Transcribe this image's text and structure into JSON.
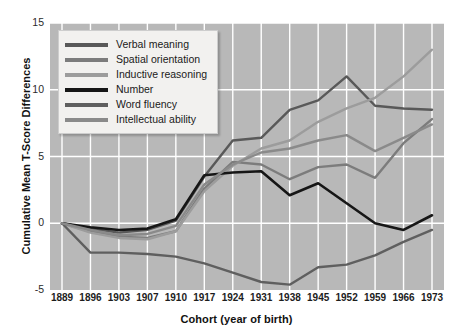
{
  "chart_data": {
    "type": "line",
    "title": "",
    "subtitle": "",
    "xlabel": "Cohort (year of birth)",
    "ylabel": "Cumulative Mean T-Score Differences",
    "categories": [
      "1889",
      "1896",
      "1903",
      "1907",
      "1910",
      "1917",
      "1924",
      "1931",
      "1938",
      "1945",
      "1952",
      "1959",
      "1966",
      "1973"
    ],
    "x": [
      1889,
      1896,
      1903,
      1907,
      1910,
      1917,
      1924,
      1931,
      1938,
      1945,
      1952,
      1959,
      1966,
      1973
    ],
    "ylim": [
      -5,
      15
    ],
    "xlim_index": [
      0,
      13
    ],
    "yticks": [
      -5,
      0,
      5,
      10,
      15
    ],
    "ytick_labels": [
      "-5",
      "0",
      "5",
      "10",
      "15"
    ],
    "grid": true,
    "grid_color": "#ffffff",
    "plot_background": "#b8b8b8",
    "legend_position": "upper-left",
    "series": [
      {
        "name": "Verbal meaning",
        "color": "#595959",
        "width": 2.4,
        "values": [
          0.0,
          -0.4,
          -0.7,
          -0.5,
          0.2,
          3.5,
          6.2,
          6.4,
          8.5,
          9.2,
          11.0,
          8.8,
          8.6,
          8.5
        ]
      },
      {
        "name": "Spatial orientation",
        "color": "#7c7c7c",
        "width": 2.4,
        "values": [
          0.0,
          -0.6,
          -1.0,
          -1.1,
          -0.6,
          2.6,
          4.6,
          4.4,
          3.3,
          4.2,
          4.4,
          3.4,
          6.0,
          7.8
        ]
      },
      {
        "name": "Inductive reasoning",
        "color": "#9c9c9c",
        "width": 2.4,
        "values": [
          0.0,
          -0.7,
          -1.1,
          -1.2,
          -0.6,
          2.4,
          4.3,
          5.6,
          6.2,
          7.6,
          8.6,
          9.4,
          11.0,
          13.0
        ]
      },
      {
        "name": "Number",
        "color": "#161616",
        "width": 2.6,
        "values": [
          0.0,
          -0.3,
          -0.5,
          -0.4,
          0.3,
          3.6,
          3.8,
          3.9,
          2.1,
          3.0,
          1.5,
          0.0,
          -0.5,
          0.6
        ]
      },
      {
        "name": "Word fluency",
        "color": "#5f5f5f",
        "width": 2.4,
        "values": [
          0.0,
          -2.2,
          -2.2,
          -2.3,
          -2.5,
          -3.0,
          -3.7,
          -4.4,
          -4.6,
          -3.3,
          -3.1,
          -2.4,
          -1.4,
          -0.5
        ]
      },
      {
        "name": "Intellectual ability",
        "color": "#8a8a8a",
        "width": 2.4,
        "values": [
          0.0,
          -0.5,
          -0.9,
          -0.8,
          -0.2,
          2.9,
          4.4,
          5.3,
          5.6,
          6.2,
          6.6,
          5.4,
          6.4,
          7.4
        ]
      }
    ]
  },
  "legend": {
    "items": [
      {
        "label": "Verbal meaning",
        "color": "#595959"
      },
      {
        "label": "Spatial orientation",
        "color": "#7c7c7c"
      },
      {
        "label": "Inductive reasoning",
        "color": "#9c9c9c"
      },
      {
        "label": "Number",
        "color": "#161616"
      },
      {
        "label": "Word fluency",
        "color": "#5f5f5f"
      },
      {
        "label": "Intellectual ability",
        "color": "#8a8a8a"
      }
    ]
  }
}
